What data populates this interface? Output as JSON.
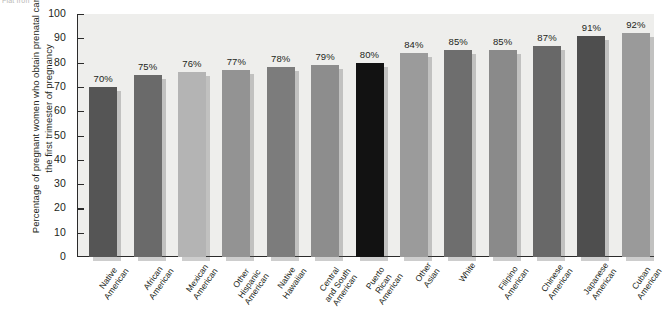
{
  "watermark": "Flat Iron",
  "chart_data": {
    "type": "bar",
    "title": "",
    "subtitle": "",
    "xlabel": "",
    "ylabel": "Percentage of pregnant women who obtain prenatal care in the first trimester of pregnancy",
    "ylim": [
      0,
      100
    ],
    "ytick_values": [
      0,
      10,
      20,
      30,
      40,
      50,
      60,
      70,
      80,
      90,
      100
    ],
    "ytick_labels": [
      "0",
      "10",
      "20",
      "30",
      "40",
      "50",
      "60",
      "70",
      "80",
      "90",
      "100"
    ],
    "grid": false,
    "legend": "none",
    "value_label_suffix": "%",
    "categories": [
      "Native American",
      "African American",
      "Mexican American",
      "Other Hispanic American",
      "Native Hawaiian",
      "Central and South American",
      "Puerto Rican American",
      "Other Asian",
      "White",
      "Filipino American",
      "Chinese American",
      "Japanese American",
      "Cuban American"
    ],
    "category_lines": [
      [
        "Native",
        "American"
      ],
      [
        "African",
        "American"
      ],
      [
        "Mexican",
        "American"
      ],
      [
        "Other",
        "Hispanic",
        "American"
      ],
      [
        "Native",
        "Hawaiian"
      ],
      [
        "Central",
        "and South",
        "American"
      ],
      [
        "Puerto",
        "Rican",
        "American"
      ],
      [
        "Other",
        "Asian"
      ],
      [
        "White"
      ],
      [
        "Filipino",
        "American"
      ],
      [
        "Chinese",
        "American"
      ],
      [
        "Japanese",
        "American"
      ],
      [
        "Cuban",
        "American"
      ]
    ],
    "values": [
      70,
      75,
      76,
      77,
      78,
      79,
      80,
      84,
      85,
      85,
      87,
      91,
      92
    ],
    "value_labels": [
      "70%",
      "75%",
      "76%",
      "77%",
      "78%",
      "79%",
      "80%",
      "84%",
      "85%",
      "85%",
      "87%",
      "91%",
      "92%"
    ],
    "bar_colors": [
      "#555555",
      "#6a6a6a",
      "#b4b4b4",
      "#939393",
      "#7c7c7c",
      "#8d8d8d",
      "#121212",
      "#9b9b9b",
      "#6e6e6e",
      "#8a8a8a",
      "#686868",
      "#4e4e4e",
      "#9a9a9a"
    ],
    "plot_background": "#eeeeec",
    "axis_color": "#2b2b2b",
    "page_background": "#ffffff"
  }
}
